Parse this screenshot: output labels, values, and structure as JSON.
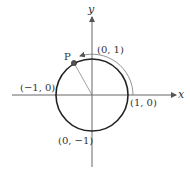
{
  "diagram": {
    "type": "unit-circle",
    "axes": {
      "x_label": "x",
      "y_label": "y"
    },
    "points": [
      {
        "id": "right",
        "label": "(1, 0)"
      },
      {
        "id": "top",
        "label": "(0, 1)"
      },
      {
        "id": "left",
        "label": "(−1, 0)"
      },
      {
        "id": "bottom",
        "label": "(0, −1)"
      }
    ],
    "moving_point": {
      "label": "P"
    },
    "colors": {
      "circle": "#222222",
      "axes": "#555555",
      "radius": "#777777",
      "arc": "#666666",
      "point_fill": "#555555"
    }
  }
}
